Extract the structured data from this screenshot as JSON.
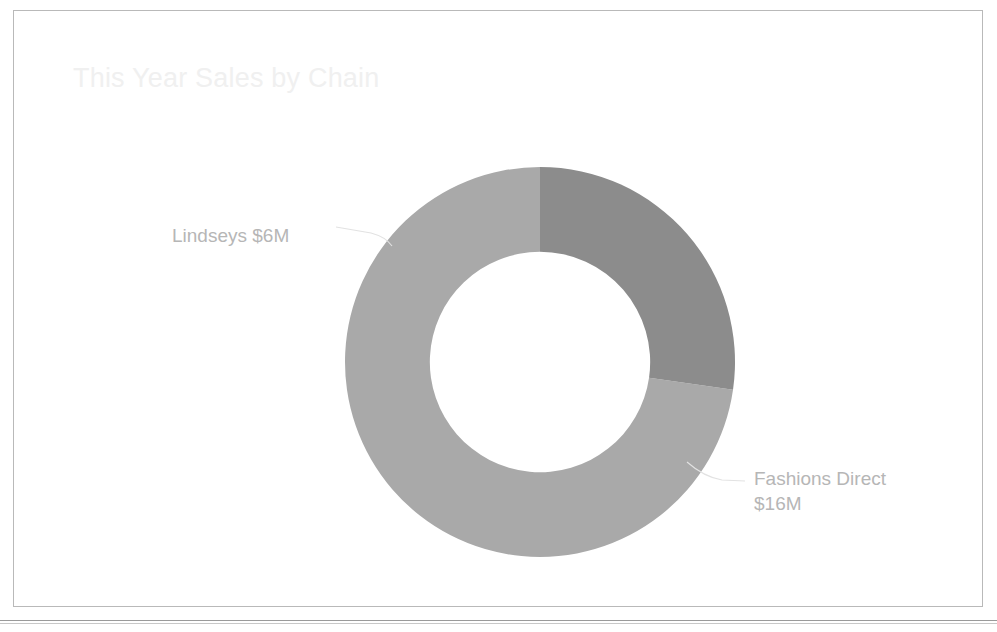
{
  "page": {
    "background_color": "#ffffff",
    "card_border_color": "#b9b9b9",
    "rule_color": "#9a9a9a"
  },
  "chart_data": {
    "type": "pie",
    "variant": "donut",
    "title": "This Year Sales by Chain",
    "title_color": "#f0f0f0",
    "label_color": "#b6b6b6",
    "leader_line_color": "#e2e2e2",
    "categories": [
      "Fashions Direct",
      "Lindseys"
    ],
    "values": [
      16,
      6
    ],
    "value_unit": "M",
    "value_prefix": "$",
    "total": 22,
    "percentages": [
      72.7,
      27.3
    ],
    "colors": [
      "#a9a9a9",
      "#8c8c8c"
    ],
    "start_angle_deg": 0,
    "direction": "counterclockwise",
    "inner_radius_ratio": 0.565,
    "legend": "none",
    "grid": false,
    "slices": [
      {
        "name": "Fashions Direct",
        "value": 16,
        "percent": 72.7,
        "color": "#a9a9a9",
        "label_line1": "Fashions Direct",
        "label_line2": "$16M"
      },
      {
        "name": "Lindseys",
        "value": 6,
        "percent": 27.3,
        "color": "#8c8c8c",
        "label_line1": "Lindseys $6M",
        "label_line2": ""
      }
    ]
  },
  "labels": {
    "lindseys": "Lindseys $6M",
    "fashions_direct_line1": "Fashions Direct",
    "fashions_direct_line2": "$16M"
  }
}
